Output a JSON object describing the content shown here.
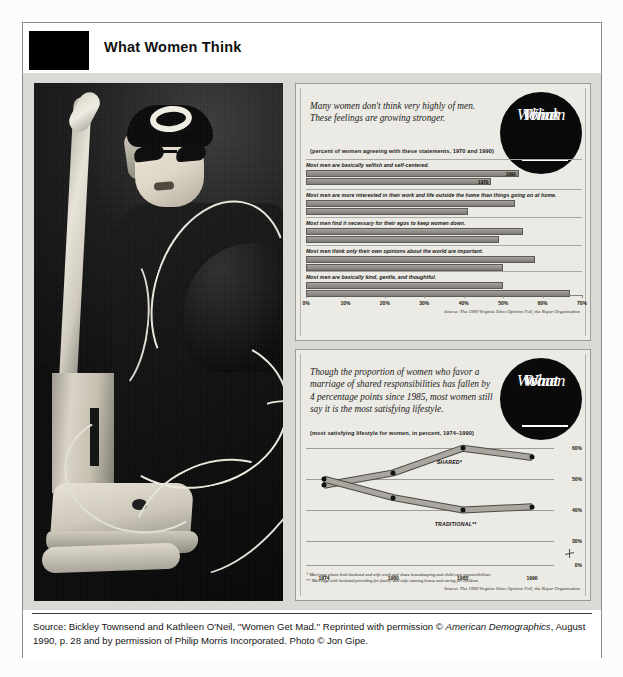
{
  "header": {
    "title": "What Women Think",
    "swatch_color": "#000000"
  },
  "photo": {
    "alt": "Black and white photograph of a woman in sunglasses and a black hat tangled in vacuum cleaner cords"
  },
  "panel_think": {
    "badge_lines": [
      "What",
      "Women",
      "Think"
    ],
    "headline": "Many women don't think very highly of men. These feelings are growing stronger.",
    "subhead": "(percent of women agreeing with these statements, 1970 and 1990)",
    "source": "Source: The 1990 Virginia Slims Opinion Poll, the Roper Organization",
    "series_labels": {
      "new": "1990",
      "old": "1970"
    }
  },
  "panel_want": {
    "badge_lines": [
      "What",
      "Women",
      "Want"
    ],
    "headline": "Though the proportion of women who favor a marriage of shared responsibilities has fallen by 4 percentage points since 1985, most women still say it is the most satisfying lifestyle.",
    "subhead": "(most satisfying lifestyle for women, in percent, 1974–1990)",
    "footnote1": "* Marriage where both husband and wife work and share housekeeping and child care responsibilities",
    "footnote2": "** Marriage with husband providing for family and wife running house and caring for children",
    "source": "Source: The 1990 Virginia Slims Opinion Poll, the Roper Organization"
  },
  "footer": {
    "line1_a": "Source: Bickley Townsend and Kathleen O'Neil, ''Women Get Mad.'' Reprinted with permission © ",
    "line1_italic": "American Demographics",
    "line1_b": ", August",
    "line2": "1990, p. 28 and by permission of Philip Morris Incorporated. Photo © Jon Gipe."
  },
  "chart_data": [
    {
      "type": "bar",
      "id": "what-women-think",
      "title": "Many women don't think very highly of men. These feelings are growing stronger.",
      "subtitle": "(percent of women agreeing with these statements, 1970 and 1990)",
      "orientation": "horizontal",
      "xlabel": "",
      "ylabel": "",
      "xlim": [
        0,
        70
      ],
      "xticks": [
        0,
        10,
        20,
        30,
        40,
        50,
        60,
        70
      ],
      "xticklabels": [
        "0%",
        "10%",
        "20%",
        "30%",
        "40%",
        "50%",
        "60%",
        "70%"
      ],
      "grid": false,
      "legend_position": "inline-bar-labels",
      "categories": [
        "Most men are basically selfish and self-centered.",
        "Most men are more interested in their work and life outside the home than things going on at home.",
        "Most men find it necessary for their egos to keep women down.",
        "Most men think only their own opinions about the world are important.",
        "Most men are basically kind, gentle, and thoughtful."
      ],
      "series": [
        {
          "name": "1990",
          "values": [
            54,
            53,
            55,
            58,
            50
          ]
        },
        {
          "name": "1970",
          "values": [
            47,
            41,
            49,
            50,
            67
          ]
        }
      ],
      "source": "Source: The 1990 Virginia Slims Opinion Poll, the Roper Organization"
    },
    {
      "type": "line",
      "id": "what-women-want",
      "title": "Though the proportion of women who favor a marriage of shared responsibilities has fallen by 4 percentage points since 1985, most women still say it is the most satisfying lifestyle.",
      "subtitle": "(most satisfying lifestyle for women, in percent, 1974–1990)",
      "x": [
        1974,
        1980,
        1985,
        1990
      ],
      "xticklabels": [
        "1974",
        "1980",
        "1985",
        "1990"
      ],
      "ylim": [
        30,
        62
      ],
      "yticks": [
        0,
        30,
        40,
        50,
        60
      ],
      "yticklabels": [
        "0%",
        "30%",
        "40%",
        "50%",
        "60%"
      ],
      "axis_break": true,
      "grid": true,
      "legend_position": "inline-annotations",
      "series": [
        {
          "name": "SHARED*",
          "values": [
            48,
            52,
            60,
            57
          ]
        },
        {
          "name": "TRADITIONAL**",
          "values": [
            50,
            44,
            40,
            41
          ]
        }
      ],
      "annotations": [
        "SHARED*",
        "TRADITIONAL**"
      ],
      "source": "Source: The 1990 Virginia Slims Opinion Poll, the Roper Organization"
    }
  ]
}
